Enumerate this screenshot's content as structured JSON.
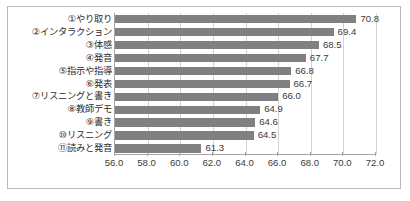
{
  "chart_data": {
    "type": "bar",
    "orientation": "horizontal",
    "title": "",
    "subtitle": "",
    "xlabel": "",
    "ylabel": "",
    "xlim": [
      56.0,
      72.0
    ],
    "xticks": [
      "56.0",
      "58.0",
      "60.0",
      "62.0",
      "64.0",
      "66.0",
      "68.0",
      "70.0",
      "72.0"
    ],
    "xtick_values": [
      56.0,
      58.0,
      60.0,
      62.0,
      64.0,
      66.0,
      68.0,
      70.0,
      72.0
    ],
    "grid": "vertical",
    "legend": "none",
    "bar_color": "#808080",
    "categories": [
      "①やり取り",
      "②インタラクション",
      "③体感",
      "④発音",
      "⑤指示や指導",
      "⑥発表",
      "⑦リスニングと書き",
      "⑧教師デモ",
      "⑨書き",
      "⑩リスニング",
      "⑪読みと発音"
    ],
    "values": [
      70.8,
      69.4,
      68.5,
      67.7,
      66.8,
      66.7,
      66.0,
      64.9,
      64.6,
      64.5,
      61.3
    ],
    "value_labels": [
      "70.8",
      "69.4",
      "68.5",
      "67.7",
      "66.8",
      "66.7",
      "66.0",
      "64.9",
      "64.6",
      "64.5",
      "61.3"
    ]
  },
  "colors": {
    "bar": "#808080",
    "grid": "#d3d3d3",
    "axis": "#a6a6a6",
    "frame": "#b9b9b9",
    "text": "#3a3a3a",
    "background": "#ffffff"
  }
}
